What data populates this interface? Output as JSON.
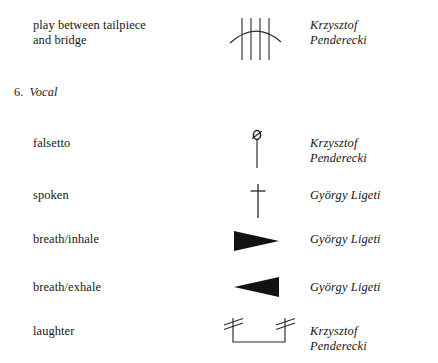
{
  "document": {
    "section": {
      "number": "6.",
      "title": "Vocal"
    }
  },
  "rows": [
    {
      "id": "play-between-tailpiece-and-bridge",
      "term": "play between tailpiece\nand bridge",
      "symbol": "four-vertical-lines-with-arc",
      "composer": "Krzysztof\nPenderecki"
    },
    {
      "id": "falsetto",
      "term": "falsetto",
      "symbol": "slashed-circle-head-with-stem",
      "composer": "Krzysztof\nPenderecki"
    },
    {
      "id": "spoken",
      "term": "spoken",
      "symbol": "dagger",
      "composer": "György Ligeti"
    },
    {
      "id": "breath-inhale",
      "term": "breath/inhale",
      "symbol": "filled-triangle-right",
      "composer": "György Ligeti"
    },
    {
      "id": "breath-exhale",
      "term": "breath/exhale",
      "symbol": "filled-triangle-left",
      "composer": "György Ligeti"
    },
    {
      "id": "laughter",
      "term": "laughter",
      "symbol": "u-bracket-with-slashed-stems",
      "composer": "Krzysztof\nPenderecki"
    }
  ],
  "colors": {
    "page_background": "#ffffff",
    "ink": "#161616",
    "stroke": "#2b2b2b"
  }
}
